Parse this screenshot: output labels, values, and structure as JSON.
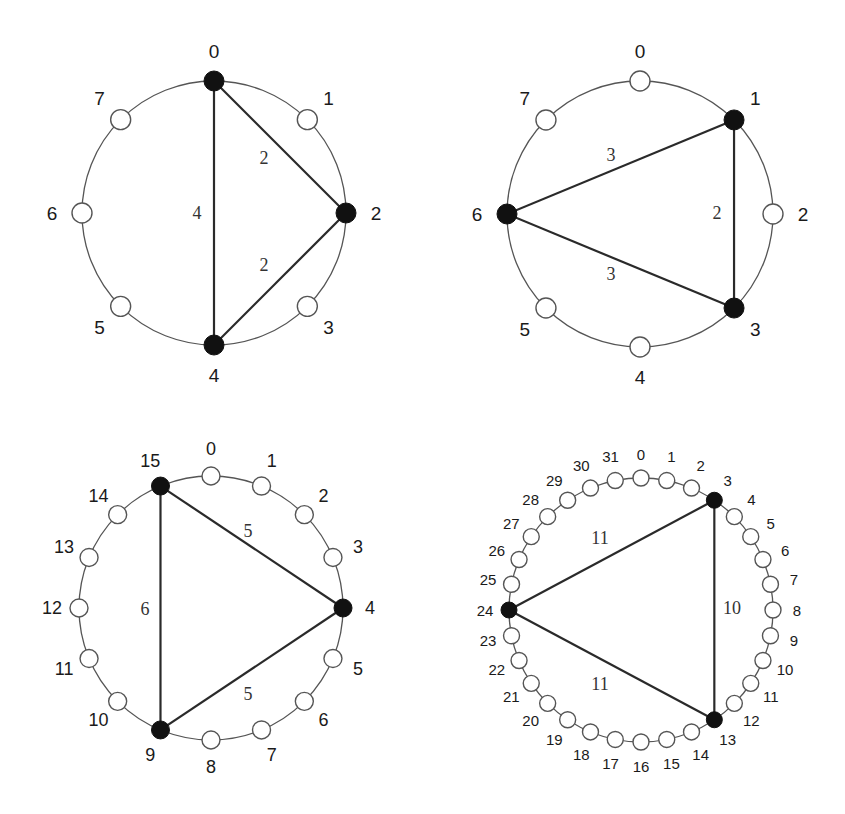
{
  "figure": {
    "panels": [
      {
        "id": "ring-8-a",
        "n": 8,
        "center": [
          214,
          213
        ],
        "radius": 132,
        "node_radius": 10,
        "label_offset": 26,
        "label_size": 19,
        "edge_label_size": 18,
        "selected": [
          0,
          2,
          4
        ],
        "node_labels": [
          "0",
          "1",
          "2",
          "3",
          "4",
          "5",
          "6",
          "7"
        ],
        "edges": [
          {
            "from": 0,
            "to": 2,
            "label": "2",
            "label_pos": [
              264,
              158
            ]
          },
          {
            "from": 2,
            "to": 4,
            "label": "2",
            "label_pos": [
              264,
              265
            ]
          },
          {
            "from": 0,
            "to": 4,
            "label": "4",
            "label_pos": [
              197,
              213
            ]
          }
        ]
      },
      {
        "id": "ring-8-b",
        "n": 8,
        "center": [
          640,
          214
        ],
        "radius": 133,
        "node_radius": 10,
        "label_offset": 26,
        "label_size": 19,
        "edge_label_size": 18,
        "selected": [
          1,
          3,
          6
        ],
        "node_labels": [
          "0",
          "1",
          "2",
          "3",
          "4",
          "5",
          "6",
          "7"
        ],
        "edges": [
          {
            "from": 1,
            "to": 6,
            "label": "3",
            "label_pos": [
              611,
              155
            ]
          },
          {
            "from": 1,
            "to": 3,
            "label": "2",
            "label_pos": [
              717,
              213
            ]
          },
          {
            "from": 6,
            "to": 3,
            "label": "3",
            "label_pos": [
              611,
              274
            ]
          }
        ]
      },
      {
        "id": "ring-16",
        "n": 16,
        "center": [
          211,
          608
        ],
        "radius": 132,
        "node_radius": 9,
        "label_offset": 24,
        "label_size": 18,
        "edge_label_size": 18,
        "selected": [
          4,
          9,
          15
        ],
        "node_labels": [
          "0",
          "1",
          "2",
          "3",
          "4",
          "5",
          "6",
          "7",
          "8",
          "9",
          "10",
          "11",
          "12",
          "13",
          "14",
          "15"
        ],
        "edges": [
          {
            "from": 15,
            "to": 4,
            "label": "5",
            "label_pos": [
              248,
              531
            ]
          },
          {
            "from": 9,
            "to": 4,
            "label": "5",
            "label_pos": [
              248,
              694
            ]
          },
          {
            "from": 15,
            "to": 9,
            "label": "6",
            "label_pos": [
              145,
              609
            ]
          }
        ]
      },
      {
        "id": "ring-32",
        "n": 32,
        "center": [
          641,
          610
        ],
        "radius": 132,
        "node_radius": 8,
        "label_offset": 22,
        "label_size": 15,
        "edge_label_size": 18,
        "selected": [
          3,
          13,
          24
        ],
        "node_labels": [
          "0",
          "1",
          "2",
          "3",
          "4",
          "5",
          "6",
          "7",
          "8",
          "9",
          "10",
          "11",
          "12",
          "13",
          "14",
          "15",
          "16",
          "17",
          "18",
          "19",
          "20",
          "21",
          "22",
          "23",
          "24",
          "25",
          "26",
          "27",
          "28",
          "29",
          "30",
          "31"
        ],
        "edges": [
          {
            "from": 3,
            "to": 24,
            "label": "11",
            "label_pos": [
              600,
              538
            ]
          },
          {
            "from": 3,
            "to": 13,
            "label": "10",
            "label_pos": [
              732,
              608
            ]
          },
          {
            "from": 24,
            "to": 13,
            "label": "11",
            "label_pos": [
              600,
              684
            ]
          }
        ]
      }
    ],
    "colors": {
      "ring": "#555555",
      "edge": "#2a2a2a",
      "node_filled": "#111111",
      "node_open": "#ffffff",
      "text": "#1a1a1a"
    }
  }
}
